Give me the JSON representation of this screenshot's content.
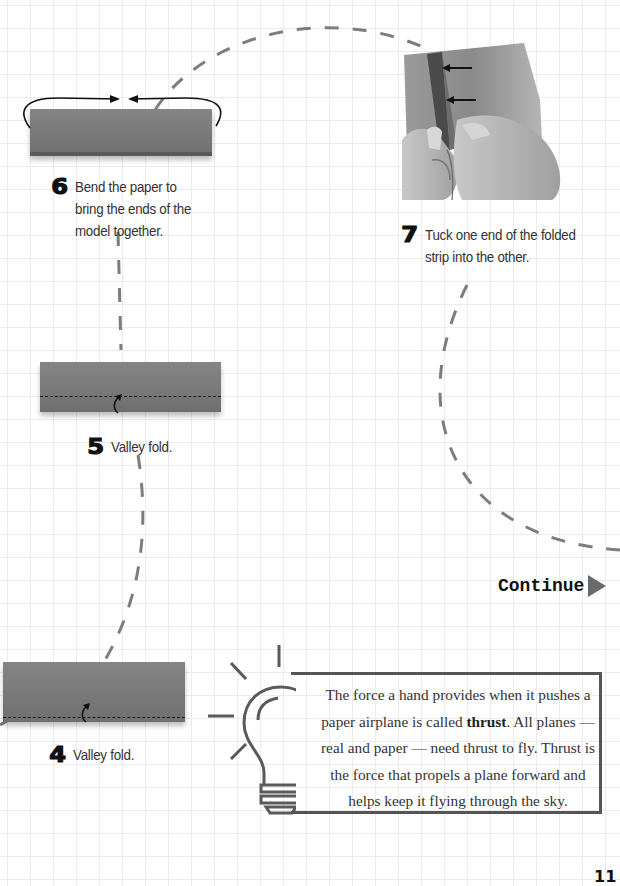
{
  "page": {
    "page_number": "11",
    "background": "grid-paper",
    "colors": {
      "paper_strip": "#7a7a7a",
      "dashed_path": "#7d7d7d",
      "text": "#333333",
      "bulb_outline": "#5a5a5a"
    }
  },
  "steps": [
    {
      "number": "4",
      "text": "Valley fold."
    },
    {
      "number": "5",
      "text": "Valley fold."
    },
    {
      "number": "6",
      "text": "Bend the paper to\nbring the ends of the\nmodel together."
    },
    {
      "number": "7",
      "text": "Tuck one end of the folded\nstrip into the other."
    }
  ],
  "continue": {
    "label": "Continue",
    "icon": "triangle-right-icon"
  },
  "tip": {
    "icon": "light-bulb-icon",
    "text_before": "The force a hand provides when it pushes a paper airplane is called ",
    "bold_term": "thrust",
    "text_after": ". All planes — real and paper — need thrust to fly. Thrust is the force that propels a plane forward and helps keep it flying through the sky."
  }
}
